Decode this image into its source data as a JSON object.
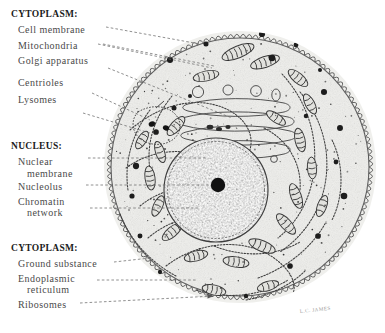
{
  "figure": {
    "signature": "L.C. JAMES",
    "ink_color": "#3a3a3a",
    "fill_color": "#efefec",
    "nucleolus_color": "#111111"
  },
  "label_groups": [
    {
      "id": "cytoplasm-top",
      "heading": "CYTOPLASM:",
      "items": [
        {
          "id": "cell-membrane",
          "line1": "Cell membrane",
          "line2": ""
        },
        {
          "id": "mitochondria",
          "line1": "Mitochondria",
          "line2": ""
        },
        {
          "id": "golgi-apparatus",
          "line1": "Golgi apparatus",
          "line2": ""
        },
        {
          "id": "centrioles",
          "line1": "Centrioles",
          "line2": ""
        },
        {
          "id": "lysomes",
          "line1": "Lysomes",
          "line2": ""
        }
      ]
    },
    {
      "id": "nucleus",
      "heading": "NUCLEUS:",
      "items": [
        {
          "id": "nuclear-membrane",
          "line1": "Nuclear",
          "line2": "membrane"
        },
        {
          "id": "nucleolus",
          "line1": "Nucleolus",
          "line2": ""
        },
        {
          "id": "chromatin-network",
          "line1": "Chromatin",
          "line2": "network"
        }
      ]
    },
    {
      "id": "cytoplasm-bottom",
      "heading": "CYTOPLASM:",
      "items": [
        {
          "id": "ground-substance",
          "line1": "Ground substance",
          "line2": ""
        },
        {
          "id": "endoplasmic-reticulum",
          "line1": "Endoplasmic",
          "line2": "reticulum"
        },
        {
          "id": "ribosomes",
          "line1": "Ribosomes",
          "line2": ""
        }
      ]
    }
  ]
}
